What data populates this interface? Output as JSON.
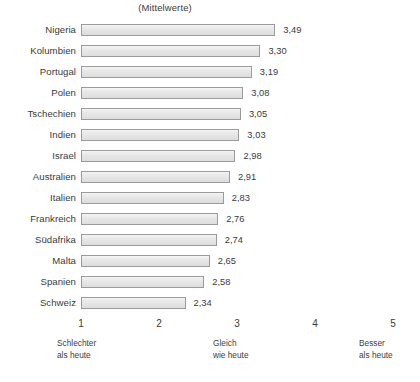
{
  "chart_data": {
    "type": "bar",
    "orientation": "horizontal",
    "title": "(Mittelwerte)",
    "xlabel": "",
    "ylabel": "",
    "xlim": [
      1,
      5
    ],
    "grid": false,
    "legend": null,
    "categories": [
      "Nigeria",
      "Kolumbien",
      "Portugal",
      "Polen",
      "Tschechien",
      "Indien",
      "Israel",
      "Australien",
      "Italien",
      "Frankreich",
      "Südafrika",
      "Malta",
      "Spanien",
      "Schweiz"
    ],
    "values": [
      3.49,
      3.3,
      3.19,
      3.08,
      3.05,
      3.03,
      2.98,
      2.91,
      2.83,
      2.76,
      2.74,
      2.65,
      2.58,
      2.34
    ],
    "value_labels": [
      "3,49",
      "3,30",
      "3,19",
      "3,08",
      "3,05",
      "3,03",
      "2,98",
      "2,91",
      "2,83",
      "2,76",
      "2,74",
      "2,65",
      "2,58",
      "2,34"
    ],
    "axis_ticks": [
      "1",
      "2",
      "3",
      "4",
      "5"
    ],
    "axis_tick_values": [
      1,
      2,
      3,
      4,
      5
    ],
    "axis_captions": [
      {
        "at": 1,
        "line1": "Schlechter",
        "line2": "als heute"
      },
      {
        "at": 3,
        "line1": "Gleich",
        "line2": "wie heute"
      },
      {
        "at": 5,
        "line1": "Besser",
        "line2": "als heute"
      }
    ],
    "colors": {
      "bar_fill": "#e8e8e8",
      "bar_border": "#9b9b9b",
      "text": "#3a3a3a",
      "background": "#ffffff"
    }
  }
}
